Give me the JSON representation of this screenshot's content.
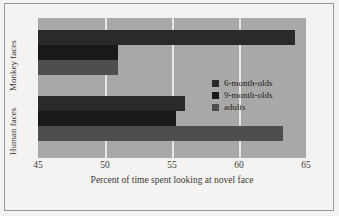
{
  "chart_data": {
    "type": "bar",
    "orientation": "horizontal",
    "title": "",
    "xlabel": "Percent of time spent looking at novel face",
    "ylabel": "",
    "xlim": [
      45,
      65
    ],
    "xticks": [
      45,
      50,
      55,
      60,
      65
    ],
    "gridlines": [
      50,
      55,
      60
    ],
    "grid": true,
    "legend_position": "upper-right",
    "categories": [
      "Monkey faces",
      "Human faces"
    ],
    "series": [
      {
        "name": "6-month-olds",
        "color": "#2a2a2a",
        "values": [
          64.2,
          56.0
        ]
      },
      {
        "name": "9-month-olds",
        "color": "#191919",
        "values": [
          51.0,
          55.3
        ]
      },
      {
        "name": "adults",
        "color": "#4e4e4e",
        "values": [
          51.0,
          63.3
        ]
      }
    ]
  },
  "axis": {
    "x_tick_labels": [
      "45",
      "50",
      "55",
      "60",
      "65"
    ],
    "x_axis_title": "Percent of time spent looking at novel face",
    "group_labels": [
      "Monkey faces",
      "Human faces"
    ]
  },
  "legend": {
    "entries": [
      {
        "label": "6-month-olds"
      },
      {
        "label": "9-month-olds"
      },
      {
        "label": "adults"
      }
    ]
  },
  "colors": {
    "plot_background": "#a9a8a6",
    "figure_background": "#f3f2f0",
    "gridline": "#e8e7e4",
    "six_month": "#2a2a2a",
    "nine_month": "#191919",
    "adults": "#4e4e4e",
    "text": "#3b3a38"
  }
}
